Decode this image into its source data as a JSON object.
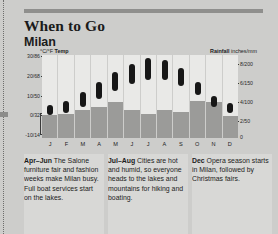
{
  "header": {
    "title": "When to Go",
    "subtitle": "Milan"
  },
  "chart_axes": {
    "temp_label": "°C/°F",
    "temp_label_bold": "Temp",
    "rain_label_bold": "Rainfall",
    "rain_label": "inches/mm",
    "zero": "0"
  },
  "notes": [
    {
      "term": "Apr–Jun",
      "text": " The Salone furniture fair and fashion weeks make Milan busy. Full boat services start on the lakes."
    },
    {
      "term": "Jul–Aug",
      "text": " Cities are hot and humid, so everyone heads to the lakes and mountains for hiking and boating."
    },
    {
      "term": "Dec",
      "text": " Opera season starts in Milan, followed by Christmas fairs."
    }
  ],
  "colors": {
    "page": "#cdcdcb",
    "panel": "#d8d8d6",
    "plot": "#e9e9e7",
    "rain_bar": "#9b9b99",
    "temp_bar": "#171717",
    "rule": "#8f8f8d"
  },
  "chart_data": {
    "type": "bar",
    "categories": [
      "J",
      "F",
      "M",
      "A",
      "M",
      "J",
      "J",
      "A",
      "S",
      "O",
      "N",
      "D"
    ],
    "month_names": [
      "January",
      "February",
      "March",
      "April",
      "May",
      "June",
      "July",
      "August",
      "September",
      "October",
      "November",
      "December"
    ],
    "grid": false,
    "legend": "none",
    "series": [
      {
        "name": "Temp",
        "type": "range-bar",
        "unit": "°C/°F",
        "axis": "left",
        "ylabel": "°C/°F Temp",
        "ylim": [
          -10,
          32
        ],
        "ytick_labels": [
          "30/86",
          "20/68",
          "10/50",
          "0/32",
          "-10/14"
        ],
        "ytick_values": [
          30,
          20,
          10,
          0,
          -10
        ],
        "low_c": [
          0,
          1,
          4,
          8,
          12,
          16,
          18,
          18,
          15,
          10,
          4,
          1
        ],
        "high_c": [
          5,
          7,
          12,
          17,
          22,
          26,
          29,
          28,
          24,
          17,
          10,
          6
        ]
      },
      {
        "name": "Rainfall",
        "type": "bar",
        "unit": "inches/mm",
        "axis": "right",
        "ylabel": "Rainfall inches/mm",
        "ylim": [
          0,
          9
        ],
        "ytick_labels": [
          "8/200",
          "6/150",
          "4/100",
          "2/50",
          "0"
        ],
        "ytick_values": [
          8,
          6,
          4,
          2,
          0
        ],
        "values_inches": [
          2.5,
          2.6,
          3.1,
          3.4,
          3.9,
          3.1,
          2.6,
          3.1,
          2.9,
          4.1,
          3.9,
          2.4
        ]
      }
    ]
  }
}
